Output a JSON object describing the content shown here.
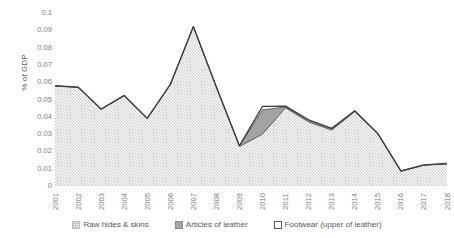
{
  "chart_data": {
    "type": "area",
    "stacked": true,
    "title": "",
    "subtitle": "",
    "xlabel": "",
    "ylabel": "% of GDP",
    "categories": [
      "2001",
      "2002",
      "2003",
      "2004",
      "2005",
      "2006",
      "2007",
      "2008",
      "2009",
      "2010",
      "2011",
      "2012",
      "2013",
      "2014",
      "2015",
      "2016",
      "2017",
      "2018"
    ],
    "ylim": [
      0,
      0.1
    ],
    "ytick_labels": [
      "0",
      "0.01",
      "0.02",
      "0.03",
      "0.04",
      "0.05",
      "0.06",
      "0.07",
      "0.08",
      "0.09",
      "0.1"
    ],
    "ytick_values": [
      0,
      0.01,
      0.02,
      0.03,
      0.04,
      0.05,
      0.06,
      0.07,
      0.08,
      0.09,
      0.1
    ],
    "grid": false,
    "legend_position": "bottom",
    "series": [
      {
        "name": "Raw hides & skins",
        "swatch_color": "#f2f2f2",
        "fill": "dotted",
        "values": [
          0.0578,
          0.057,
          0.0443,
          0.0522,
          0.039,
          0.0585,
          0.092,
          0.057,
          0.0228,
          0.03,
          0.0452,
          0.037,
          0.0323,
          0.043,
          0.03,
          0.0085,
          0.012,
          0.0128
        ]
      },
      {
        "name": "Articles of leather",
        "swatch_color": "#a6a6a6",
        "fill": "solid-gray",
        "values": [
          0.0,
          0.0,
          0.0,
          0.0,
          0.0,
          0.0,
          0.0,
          0.0,
          0.0003,
          0.014,
          0.0005,
          0.001,
          0.0008,
          0.0003,
          0.0002,
          0.0001,
          0.0001,
          0.0001
        ]
      },
      {
        "name": "Footwear (upper of leather)",
        "swatch_color": "#ffffff",
        "fill": "white",
        "values": [
          0.0002,
          0.0002,
          0.0002,
          0.0002,
          0.0002,
          0.0002,
          0.0002,
          0.0002,
          0.0002,
          0.002,
          0.0005,
          0.0003,
          0.0002,
          0.0002,
          0.0002,
          0.0001,
          0.0001,
          0.0001
        ]
      }
    ],
    "totals": [
      0.058,
      0.0572,
      0.0445,
      0.0524,
      0.0392,
      0.0587,
      0.0922,
      0.0572,
      0.0233,
      0.046,
      0.0462,
      0.0383,
      0.0333,
      0.0435,
      0.0304,
      0.0087,
      0.0122,
      0.013
    ]
  },
  "axes": {
    "y_title": "% of GDP"
  },
  "legend": {
    "items": [
      {
        "label": "Raw hides & skins",
        "marker": "dotted-square-icon",
        "color": "#f2f2f2"
      },
      {
        "label": "Articles of leather",
        "marker": "filled-square-icon",
        "color": "#a6a6a6"
      },
      {
        "label": "Footwear (upper of leather)",
        "marker": "outline-square-icon",
        "color": "#ffffff"
      }
    ]
  },
  "style": {
    "line_color": "#404040",
    "axis_color": "#d9d9d9",
    "tick_text_color": "#808080",
    "background": "#ffffff"
  }
}
